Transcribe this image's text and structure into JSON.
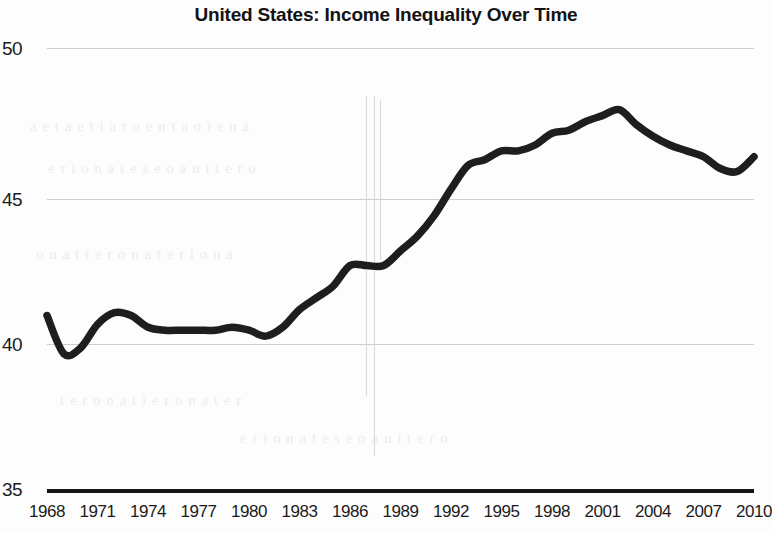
{
  "chart_data": {
    "type": "line",
    "title": "United States: Income Inequality Over Time",
    "xlabel": "",
    "ylabel": "",
    "xlim": [
      1967,
      2011
    ],
    "ylim": [
      35,
      50
    ],
    "grid": true,
    "legend": "none",
    "y_ticks": [
      50,
      45,
      40,
      35
    ],
    "x_ticks": [
      1968,
      1971,
      1974,
      1977,
      1980,
      1983,
      1986,
      1989,
      1992,
      1995,
      1998,
      2001,
      2004,
      2007,
      2010
    ],
    "series": [
      {
        "name": "Gini index",
        "color": "#1e1e1e",
        "x": [
          1968,
          1969,
          1970,
          1971,
          1972,
          1973,
          1974,
          1975,
          1976,
          1977,
          1978,
          1979,
          1980,
          1981,
          1982,
          1983,
          1984,
          1985,
          1986,
          1987,
          1988,
          1989,
          1990,
          1991,
          1992,
          1993,
          1994,
          1995,
          1996,
          1997,
          1998,
          1999,
          2000,
          2001,
          2002,
          2003,
          2004,
          2005,
          2006,
          2007,
          2008,
          2009,
          2010
        ],
        "values": [
          40.9,
          39.6,
          39.8,
          40.6,
          41.0,
          40.9,
          40.5,
          40.4,
          40.4,
          40.4,
          40.4,
          40.5,
          40.4,
          40.2,
          40.5,
          41.1,
          41.5,
          41.9,
          42.6,
          42.6,
          42.6,
          43.1,
          43.6,
          44.3,
          45.2,
          46.0,
          46.2,
          46.5,
          46.5,
          46.7,
          47.1,
          47.2,
          47.5,
          47.7,
          47.9,
          47.4,
          47.0,
          46.7,
          46.5,
          46.3,
          45.9,
          45.8,
          46.3
        ]
      }
    ]
  },
  "axis": {
    "y_label_50": "50",
    "y_label_45": "45",
    "y_label_40": "40",
    "y_label_35": "35"
  },
  "noise": {
    "line1": "a  e  t  a  e   t   i  a   r  o    e  n   t   a  o   i  e   n   a",
    "line2": "e  r   i   o   n  a   t   e  s   e    o  a   n  i   t   e  r   o",
    "line3": "o  n   a   t   i   e   r  o   n   a    t   e  r   i   o   n  a",
    "line4": "t   e  r   o   n   a   t   i  e   r    o  n   a   t   e  r"
  }
}
